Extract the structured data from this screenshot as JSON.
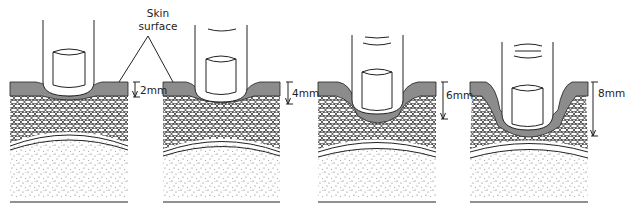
{
  "figure": {
    "annotation": {
      "line1": "Skin",
      "line2": "surface"
    },
    "colors": {
      "skin_layer": "#8c8c8c",
      "outline": "#222222",
      "background": "#ffffff"
    },
    "panels": [
      {
        "id": 1,
        "depth_label": "2mm",
        "depth_mm": 2
      },
      {
        "id": 2,
        "depth_label": "4mm",
        "depth_mm": 4
      },
      {
        "id": 3,
        "depth_label": "6mm",
        "depth_mm": 6
      },
      {
        "id": 4,
        "depth_label": "8mm",
        "depth_mm": 8
      }
    ],
    "layers": [
      "Skin surface (grey layer)",
      "Subcutaneous fat (cellular layer)",
      "Fascia",
      "Muscle (stippled)"
    ]
  }
}
